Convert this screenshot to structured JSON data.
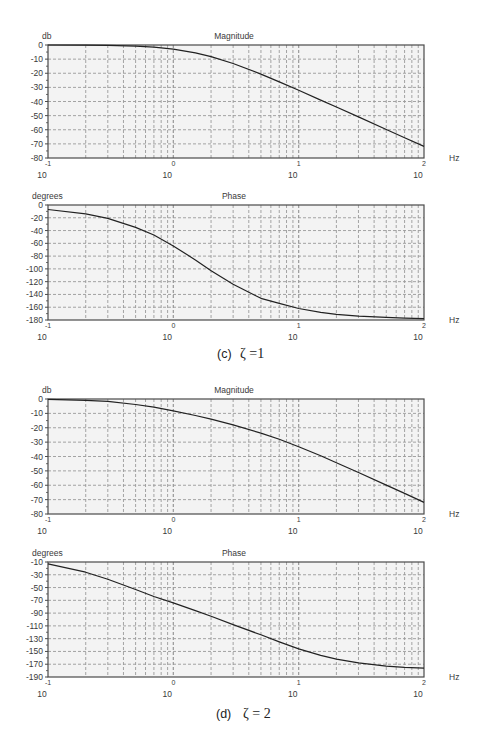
{
  "colors": {
    "background": "#ffffff",
    "plot_background": "#f3f3f3",
    "frame": "#4a4a4a",
    "grid": "#9a9a9a",
    "curve": "#222222",
    "text": "#3a3a3a"
  },
  "captions": [
    {
      "label": "(c)",
      "text": "ζ =1"
    },
    {
      "label": "(d)",
      "text": "ζ = 2"
    }
  ],
  "chart_data": [
    {
      "type": "line",
      "panel": "(c) ζ=1",
      "title": "Magnitude",
      "ylabel": "db",
      "xlabel": "Hz",
      "xscale": "log",
      "xlim": [
        0.1,
        100
      ],
      "ylim": [
        -80,
        0
      ],
      "grid": true,
      "yticks": [
        "0",
        "-10",
        "-20",
        "-30",
        "-40",
        "-50",
        "-60",
        "-70",
        "-80"
      ],
      "ytick_values": [
        0,
        -10,
        -20,
        -30,
        -40,
        -50,
        -60,
        -70,
        -80
      ],
      "xticks": [
        {
          "value": 0.1,
          "base": "10",
          "exp": "-1"
        },
        {
          "value": 1,
          "base": "10",
          "exp": "0"
        },
        {
          "value": 10,
          "base": "10",
          "exp": "1"
        },
        {
          "value": 100,
          "base": "10",
          "exp": "2"
        }
      ],
      "series": [
        {
          "name": "magnitude ζ=1",
          "x": [
            0.1,
            0.2,
            0.3,
            0.5,
            0.7,
            1,
            1.5,
            2,
            3,
            5,
            7,
            10,
            15,
            20,
            30,
            50,
            70,
            100
          ],
          "y": [
            0,
            -0.1,
            -0.3,
            -0.8,
            -1.5,
            -2.9,
            -5.5,
            -8.2,
            -13.1,
            -20.6,
            -26.1,
            -32.1,
            -39.0,
            -43.9,
            -50.9,
            -59.8,
            -65.6,
            -71.8
          ]
        }
      ]
    },
    {
      "type": "line",
      "panel": "(c) ζ=1",
      "title": "Phase",
      "ylabel": "degrees",
      "xlabel": "Hz",
      "xscale": "log",
      "xlim": [
        0.1,
        100
      ],
      "ylim": [
        -180,
        0
      ],
      "grid": true,
      "yticks": [
        "0",
        "-20",
        "-40",
        "-60",
        "-80",
        "-100",
        "-120",
        "-140",
        "-160",
        "-180"
      ],
      "ytick_values": [
        0,
        -20,
        -40,
        -60,
        -80,
        -100,
        -120,
        -140,
        -160,
        -180
      ],
      "xticks": [
        {
          "value": 0.1,
          "base": "10",
          "exp": "-1"
        },
        {
          "value": 1,
          "base": "10",
          "exp": "0"
        },
        {
          "value": 10,
          "base": "10",
          "exp": "1"
        },
        {
          "value": 100,
          "base": "10",
          "exp": "2"
        }
      ],
      "series": [
        {
          "name": "phase ζ=1",
          "x": [
            0.1,
            0.2,
            0.3,
            0.5,
            0.7,
            1,
            1.5,
            2,
            3,
            5,
            7,
            10,
            15,
            20,
            30,
            50,
            70,
            100
          ],
          "y": [
            -7,
            -14,
            -21,
            -35,
            -47,
            -64,
            -86,
            -103,
            -124,
            -146,
            -154,
            -162,
            -168,
            -171,
            -174,
            -176,
            -177,
            -178
          ]
        }
      ]
    },
    {
      "type": "line",
      "panel": "(d) ζ=2",
      "title": "Magnitude",
      "ylabel": "db",
      "xlabel": "Hz",
      "xscale": "log",
      "xlim": [
        0.1,
        100
      ],
      "ylim": [
        -80,
        0
      ],
      "grid": true,
      "yticks": [
        "0",
        "-10",
        "-20",
        "-30",
        "-40",
        "-50",
        "-60",
        "-70",
        "-80"
      ],
      "ytick_values": [
        0,
        -10,
        -20,
        -30,
        -40,
        -50,
        -60,
        -70,
        -80
      ],
      "xticks": [
        {
          "value": 0.1,
          "base": "10",
          "exp": "-1"
        },
        {
          "value": 1,
          "base": "10",
          "exp": "0"
        },
        {
          "value": 10,
          "base": "10",
          "exp": "1"
        },
        {
          "value": 100,
          "base": "10",
          "exp": "2"
        }
      ],
      "series": [
        {
          "name": "magnitude ζ=2",
          "x": [
            0.1,
            0.2,
            0.3,
            0.5,
            0.7,
            1,
            1.5,
            2,
            3,
            5,
            7,
            10,
            15,
            20,
            30,
            50,
            70,
            100
          ],
          "y": [
            -0.2,
            -0.9,
            -1.7,
            -3.8,
            -5.7,
            -8.2,
            -11.5,
            -14.0,
            -18.0,
            -23.7,
            -28.0,
            -33.2,
            -39.5,
            -44.3,
            -51.1,
            -59.9,
            -65.7,
            -71.9
          ]
        }
      ]
    },
    {
      "type": "line",
      "panel": "(d) ζ=2",
      "title": "Phase",
      "ylabel": "degrees",
      "xlabel": "Hz",
      "xscale": "log",
      "xlim": [
        0.1,
        100
      ],
      "ylim": [
        -190,
        -10
      ],
      "grid": true,
      "yticks": [
        "-10",
        "-30",
        "-50",
        "-70",
        "-90",
        "-110",
        "-130",
        "-150",
        "-170",
        "-190"
      ],
      "ytick_values": [
        -10,
        -30,
        -50,
        -70,
        -90,
        -110,
        -130,
        -150,
        -170,
        -190
      ],
      "xticks": [
        {
          "value": 0.1,
          "base": "10",
          "exp": "-1"
        },
        {
          "value": 1,
          "base": "10",
          "exp": "0"
        },
        {
          "value": 10,
          "base": "10",
          "exp": "1"
        },
        {
          "value": 100,
          "base": "10",
          "exp": "2"
        }
      ],
      "series": [
        {
          "name": "phase ζ=2",
          "x": [
            0.1,
            0.2,
            0.3,
            0.5,
            0.7,
            1,
            1.5,
            2,
            3,
            5,
            7,
            10,
            15,
            20,
            30,
            50,
            70,
            100
          ],
          "y": [
            -13,
            -26,
            -37,
            -53,
            -64,
            -74,
            -86,
            -95,
            -108,
            -124,
            -135,
            -146,
            -156,
            -162,
            -168,
            -173,
            -175,
            -176
          ]
        }
      ]
    }
  ]
}
